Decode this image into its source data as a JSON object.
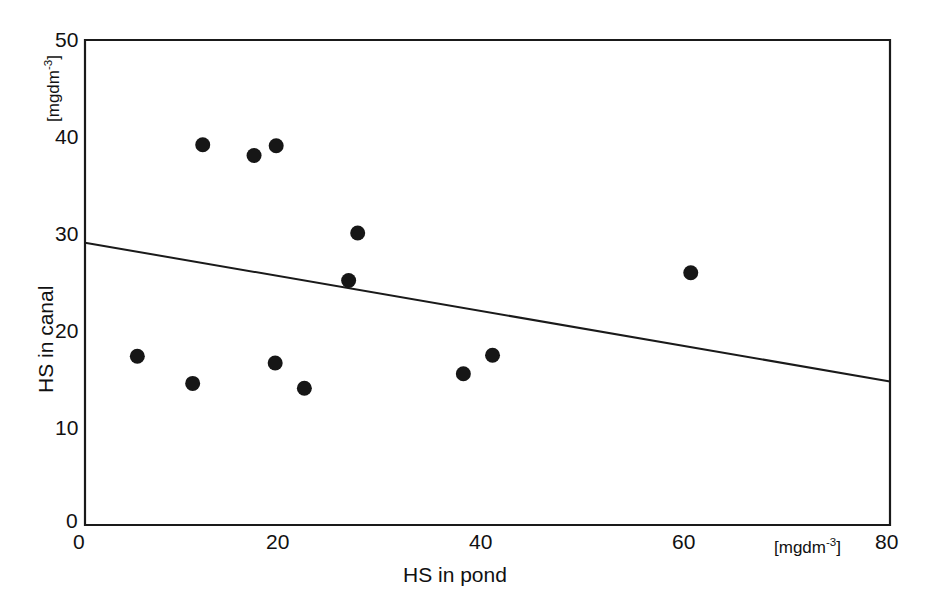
{
  "chart_data": {
    "type": "scatter",
    "title": "",
    "xlabel": "HS in pond",
    "ylabel": "HS in canal",
    "x_unit": "[mgdm-3]",
    "y_unit": "[mgdm-3]",
    "xlim": [
      0,
      80
    ],
    "ylim": [
      0,
      50
    ],
    "xticks": [
      0,
      20,
      40,
      60,
      80
    ],
    "yticks": [
      0,
      10,
      20,
      30,
      40,
      50
    ],
    "xtick_labels": [
      "0",
      "20",
      "40",
      "60",
      "80"
    ],
    "ytick_labels": [
      "0",
      "10",
      "20",
      "30",
      "40",
      "50"
    ],
    "grid": false,
    "legend": null,
    "points": [
      {
        "x": 5.2,
        "y": 17.4
      },
      {
        "x": 10.7,
        "y": 14.6
      },
      {
        "x": 11.7,
        "y": 39.2
      },
      {
        "x": 16.8,
        "y": 38.1
      },
      {
        "x": 18.9,
        "y": 16.7
      },
      {
        "x": 19.0,
        "y": 39.1
      },
      {
        "x": 21.8,
        "y": 14.1
      },
      {
        "x": 26.2,
        "y": 25.2
      },
      {
        "x": 27.1,
        "y": 30.1
      },
      {
        "x": 37.6,
        "y": 15.6
      },
      {
        "x": 40.5,
        "y": 17.5
      },
      {
        "x": 60.2,
        "y": 26.0
      }
    ],
    "trendline": {
      "x0": 0,
      "y0": 29.1,
      "x1": 80,
      "y1": 14.8
    }
  },
  "axes": {
    "y_axis_unit_label": "[mgdm",
    "y_axis_unit_exp": "-3",
    "y_axis_unit_close": "]",
    "x_axis_unit_label": "[mgdm",
    "x_axis_unit_exp": "-3",
    "x_axis_unit_close": "]",
    "y_axis_title": "HS in canal",
    "x_axis_title": "HS in pond",
    "origin_label_y": "0",
    "origin_label_x": "0"
  }
}
